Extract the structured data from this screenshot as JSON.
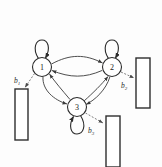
{
  "figure": {
    "background_color": "#fdfdfd",
    "stroke_color": "#2b2b2b",
    "dashed_color": "#6e6e6e"
  },
  "nodes": [
    {
      "id": "1",
      "label": "1",
      "cx": 42,
      "cy": 67,
      "r": 9.5,
      "self_loop": "top"
    },
    {
      "id": "2",
      "label": "2",
      "cx": 112,
      "cy": 67,
      "r": 9.5,
      "self_loop": "top"
    },
    {
      "id": "3",
      "label": "3",
      "cx": 77,
      "cy": 107,
      "r": 9.5,
      "self_loop": "bottom"
    }
  ],
  "edges": [
    {
      "from": "1",
      "to": "2",
      "style": "curved",
      "arrow": "end"
    },
    {
      "from": "2",
      "to": "1",
      "style": "curved",
      "arrow": "end"
    },
    {
      "from": "1",
      "to": "3",
      "style": "curved",
      "arrow": "end"
    },
    {
      "from": "3",
      "to": "1",
      "style": "curved",
      "arrow": "end"
    },
    {
      "from": "2",
      "to": "3",
      "style": "curved",
      "arrow": "end"
    },
    {
      "from": "3",
      "to": "2",
      "style": "curved",
      "arrow": "end"
    },
    {
      "from": "1",
      "to": "1",
      "style": "self-loop",
      "arrow": "end"
    },
    {
      "from": "2",
      "to": "2",
      "style": "self-loop",
      "arrow": "end"
    },
    {
      "from": "3",
      "to": "3",
      "style": "self-loop",
      "arrow": "end"
    }
  ],
  "outputs": [
    {
      "id": "b1",
      "label_base": "b",
      "label_sub": "1",
      "from_node": "1",
      "label_x": 20,
      "label_y": 83,
      "box": {
        "x": 15,
        "y": 89,
        "width": 13,
        "height": 51
      },
      "arrow_style": "dashed"
    },
    {
      "id": "b2",
      "label_base": "b",
      "label_sub": "2",
      "from_node": "2",
      "label_x": 124,
      "label_y": 84,
      "box": {
        "x": 136,
        "y": 58,
        "width": 14,
        "height": 50
      },
      "arrow_style": "dashed"
    },
    {
      "id": "b3",
      "label_base": "b",
      "label_sub": "3",
      "from_node": "3",
      "label_x": 92,
      "label_y": 131,
      "box": {
        "x": 106,
        "y": 116,
        "width": 14,
        "height": 51
      },
      "arrow_style": "dashed"
    }
  ]
}
